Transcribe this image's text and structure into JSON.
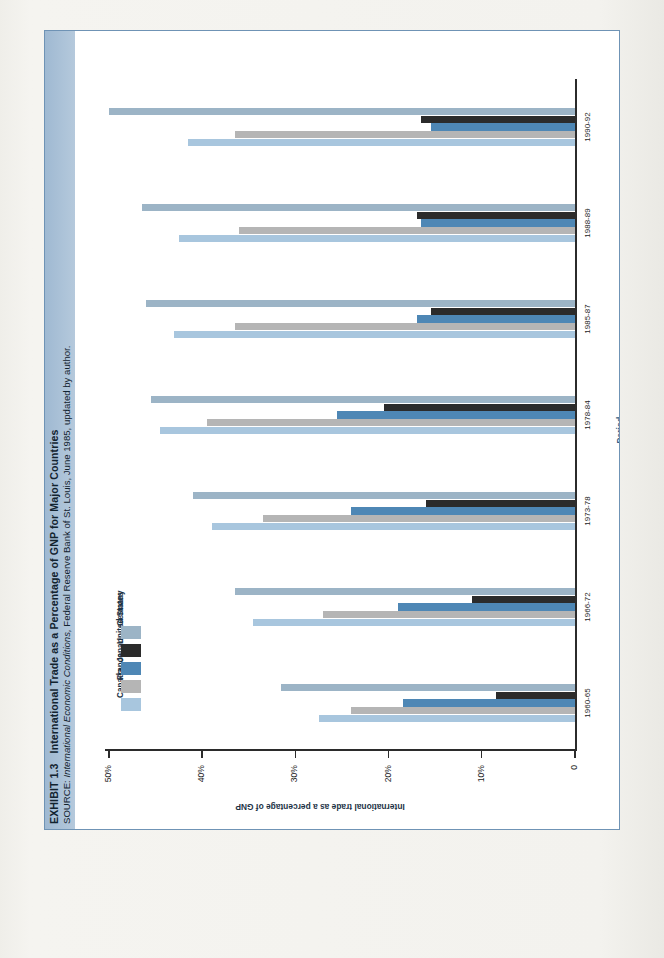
{
  "exhibit": {
    "number": "EXHIBIT 1.3",
    "title": "International Trade as a Percentage of GNP for Major Countries",
    "source_prefix": "SOURCE:",
    "source_italic": "International Economic Conditions,",
    "source_rest": "Federal Reserve Bank of St. Louis, June 1985, updated by author."
  },
  "colors": {
    "canada": "#a8c6de",
    "france": "#b5b5b5",
    "japan": "#4e87b5",
    "united_states": "#2b2b2b",
    "germany": "#9cb4c6",
    "frame": "#6f93b5",
    "title_band": "#a8c0d6",
    "axis": "#2b2b2b",
    "axis_text": "#1d1d1d",
    "label_blue": "#2f5d86"
  },
  "chart_data": {
    "type": "bar",
    "orientation": "horizontal-rotated",
    "title": "International Trade as a Percentage of GNP for Major Countries",
    "xlabel": "Period",
    "ylabel": "International trade as a percentage of GNP",
    "categories": [
      "1960-65",
      "1966-72",
      "1973-78",
      "1978-84",
      "1985-87",
      "1988-89",
      "1990-92"
    ],
    "ylim": [
      0,
      50
    ],
    "yticks": [
      0,
      10,
      20,
      30,
      40,
      50
    ],
    "ytick_labels": [
      "0",
      "10%",
      "20%",
      "30%",
      "40%",
      "50%"
    ],
    "grid": false,
    "legend_position": "upper-left",
    "series": [
      {
        "name": "Canada",
        "color": "#a8c6de",
        "values": [
          27.5,
          34.5,
          39.0,
          44.5,
          43.0,
          42.5,
          41.5
        ]
      },
      {
        "name": "France",
        "color": "#b5b5b5",
        "values": [
          24.0,
          27.0,
          33.5,
          39.5,
          36.5,
          36.0,
          36.5
        ]
      },
      {
        "name": "Japan",
        "color": "#4e87b5",
        "values": [
          18.5,
          19.0,
          24.0,
          25.5,
          17.0,
          16.5,
          15.5
        ]
      },
      {
        "name": "United States",
        "color": "#2b2b2b",
        "values": [
          8.5,
          11.0,
          16.0,
          20.5,
          15.5,
          17.0,
          16.5
        ]
      },
      {
        "name": "Germany",
        "color": "#9cb4c6",
        "values": [
          31.5,
          36.5,
          41.0,
          45.5,
          46.0,
          46.5,
          50.0
        ]
      }
    ],
    "legend": [
      "Canada",
      "France",
      "Japan",
      "United States",
      "Germany"
    ]
  }
}
